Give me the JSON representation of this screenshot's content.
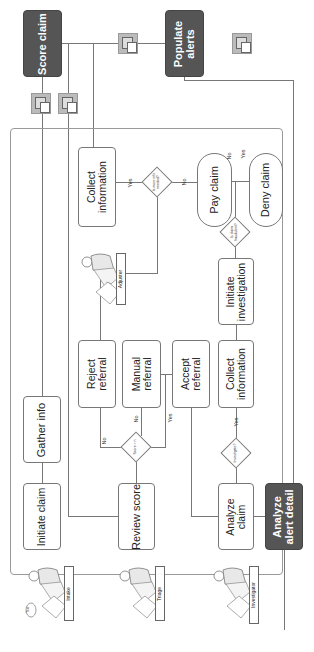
{
  "diagram": {
    "orientation": "rotated-90-ccw",
    "systems": {
      "score_claim": "Score claim",
      "populate_alerts": "Populate alerts",
      "analyze_alert_detail": "Analyze alert detail"
    },
    "roles": {
      "intake": "Intake",
      "triage": "Triage",
      "adjuster": "Adjuster",
      "investigator": "Investigator"
    },
    "intake_speech": "Text",
    "steps": {
      "initiate_claim": "Initiate claim",
      "gather_info": "Gather info",
      "review_score": "Review score",
      "reject_referral": "Reject referral",
      "manual_referral": "Manual referral",
      "accept_referral": "Accept referral",
      "collect_information_adjuster": "Collect information",
      "analyze_claim": "Analyze claim",
      "collect_information_investigator": "Collect information",
      "initiate_investigation": "Initiate investigation",
      "pay_claim": "Pay claim",
      "deny_claim": "Deny claim"
    },
    "decisions": {
      "score": "Score > n",
      "more_info": "Is more info needed?",
      "investigate": "Investigate?",
      "fraudulent": "Is claim fraudulent?"
    },
    "edge_labels": {
      "yes": "Yes",
      "no": "No"
    },
    "colors": {
      "system_box": "#555555",
      "border": "#777777",
      "icon_fill": "#bbbbbb",
      "background": "#ffffff"
    }
  }
}
